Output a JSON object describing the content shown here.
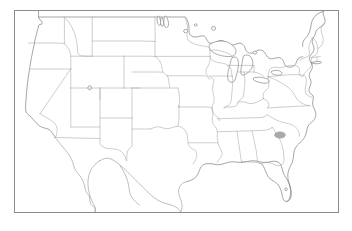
{
  "figure": {
    "title": "Blank outline map of the contiguous United States",
    "caption": "",
    "background_color": "#ffffff",
    "frame_color": "#8c8c8c",
    "state_border_color": "#a6a6a6",
    "coastline_color": "#6f6f6f",
    "highlight_color": "#a9a9a9"
  },
  "frame": {
    "label": "map-frame",
    "x": 14,
    "y": 10,
    "width": 325,
    "height": 203
  },
  "legend": {
    "visible": false,
    "entries": []
  },
  "annotations": [
    {
      "name": "south-carolina-highlight",
      "label": "",
      "region": "South Carolina",
      "color": "#a9a9a9",
      "shape": "ellipse",
      "cx": 280,
      "cy": 135,
      "rx": 5.5,
      "ry": 3.2
    }
  ],
  "features": {
    "water_bodies": [
      "Lake Superior",
      "Lake Michigan",
      "Lake Huron",
      "Lake Erie",
      "Lake Ontario",
      "Lake Winnipeg",
      "Lake of the Woods",
      "Great Salt Lake",
      "Lake Okeechobee",
      "Chesapeake Bay"
    ],
    "neighbor_countries": [
      "Canada",
      "Mexico"
    ],
    "states_outlined": [
      "Washington",
      "Oregon",
      "California",
      "Idaho",
      "Nevada",
      "Montana",
      "Wyoming",
      "Utah",
      "Arizona",
      "Colorado",
      "New Mexico",
      "North Dakota",
      "South Dakota",
      "Nebraska",
      "Kansas",
      "Oklahoma",
      "Texas",
      "Minnesota",
      "Iowa",
      "Missouri",
      "Arkansas",
      "Louisiana",
      "Wisconsin",
      "Illinois",
      "Michigan",
      "Indiana",
      "Ohio",
      "Kentucky",
      "Tennessee",
      "Mississippi",
      "Alabama",
      "Georgia",
      "Florida",
      "South Carolina",
      "North Carolina",
      "Virginia",
      "West Virginia",
      "Maryland",
      "Delaware",
      "Pennsylvania",
      "New Jersey",
      "New York",
      "Connecticut",
      "Rhode Island",
      "Massachusetts",
      "Vermont",
      "New Hampshire",
      "Maine"
    ]
  }
}
